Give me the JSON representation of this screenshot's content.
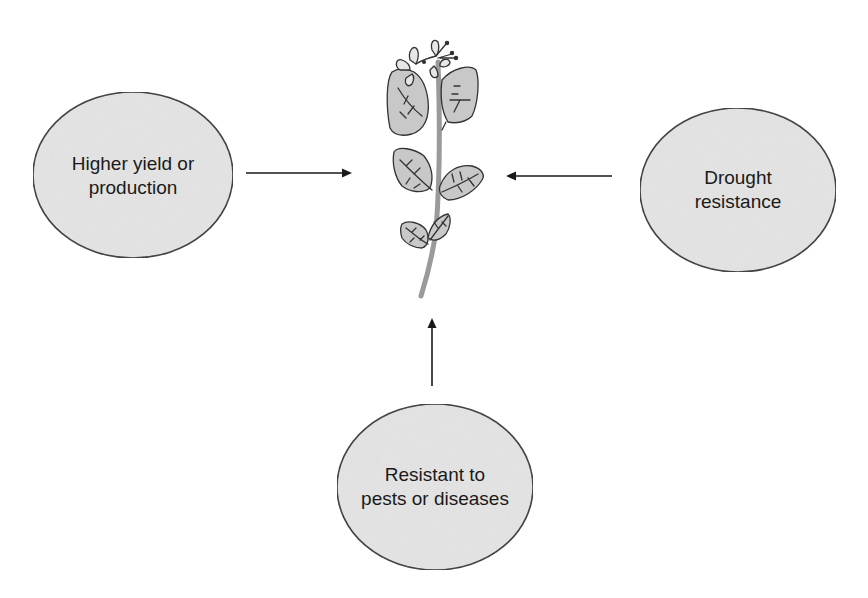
{
  "diagram": {
    "type": "hub-and-spoke",
    "center": {
      "name": "plant",
      "icon": "plant-icon"
    },
    "nodes": [
      {
        "id": "yield",
        "line1": "Higher yield or",
        "line2": "production",
        "position": "left",
        "arrow_direction": "right"
      },
      {
        "id": "drought",
        "line1": "Drought",
        "line2": "resistance",
        "position": "right",
        "arrow_direction": "left"
      },
      {
        "id": "pests",
        "line1": "Resistant to",
        "line2": "pests or diseases",
        "position": "bottom",
        "arrow_direction": "up"
      }
    ],
    "colors": {
      "ellipse_fill": "#e4e4e4",
      "ellipse_stroke": "#333333",
      "arrow": "#1a1a1a",
      "leaf_fill": "#c8c8c8",
      "stem": "#9a9a9a",
      "petal_fill": "#e6e6e6"
    }
  }
}
